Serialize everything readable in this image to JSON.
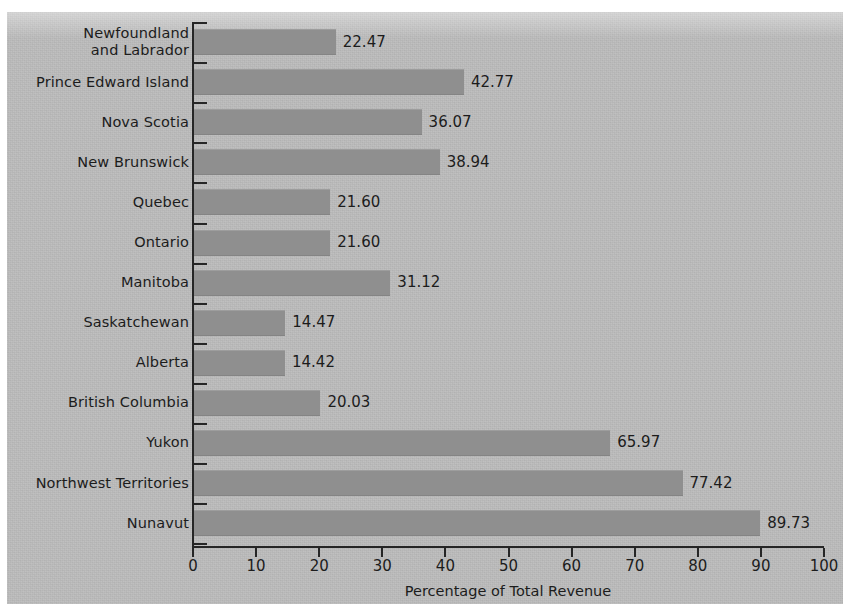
{
  "chart_data": {
    "type": "bar",
    "orientation": "horizontal",
    "title": "",
    "xlabel": "Percentage of Total Revenue",
    "ylabel": "",
    "xlim": [
      0,
      100
    ],
    "xticks": [
      "0",
      "10",
      "20",
      "30",
      "40",
      "50",
      "60",
      "70",
      "80",
      "90",
      "100"
    ],
    "grid": false,
    "legend": false,
    "categories": [
      "Newfoundland\nand Labrador",
      "Prince Edward Island",
      "Nova Scotia",
      "New Brunswick",
      "Quebec",
      "Ontario",
      "Manitoba",
      "Saskatchewan",
      "Alberta",
      "British Columbia",
      "Yukon",
      "Northwest Territories",
      "Nunavut"
    ],
    "values": [
      22.47,
      42.77,
      36.07,
      38.94,
      21.6,
      21.6,
      31.12,
      14.47,
      14.42,
      20.03,
      65.97,
      77.42,
      89.73
    ],
    "value_labels": [
      "22.47",
      "42.77",
      "36.07",
      "38.94",
      "21.60",
      "21.60",
      "31.12",
      "14.47",
      "14.42",
      "20.03",
      "65.97",
      "77.42",
      "89.73"
    ]
  },
  "rows": [
    {
      "label_line1": "Newfoundland",
      "label_line2": "and Labrador",
      "value": 22.47,
      "value_label": "22.47"
    },
    {
      "label_line1": "Prince Edward Island",
      "label_line2": "",
      "value": 42.77,
      "value_label": "42.77"
    },
    {
      "label_line1": "Nova Scotia",
      "label_line2": "",
      "value": 36.07,
      "value_label": "36.07"
    },
    {
      "label_line1": "New Brunswick",
      "label_line2": "",
      "value": 38.94,
      "value_label": "38.94"
    },
    {
      "label_line1": "Quebec",
      "label_line2": "",
      "value": 21.6,
      "value_label": "21.60"
    },
    {
      "label_line1": "Ontario",
      "label_line2": "",
      "value": 21.6,
      "value_label": "21.60"
    },
    {
      "label_line1": "Manitoba",
      "label_line2": "",
      "value": 31.12,
      "value_label": "31.12"
    },
    {
      "label_line1": "Saskatchewan",
      "label_line2": "",
      "value": 14.47,
      "value_label": "14.47"
    },
    {
      "label_line1": "Alberta",
      "label_line2": "",
      "value": 14.42,
      "value_label": "14.42"
    },
    {
      "label_line1": "British Columbia",
      "label_line2": "",
      "value": 20.03,
      "value_label": "20.03"
    },
    {
      "label_line1": "Yukon",
      "label_line2": "",
      "value": 65.97,
      "value_label": "65.97"
    },
    {
      "label_line1": "Northwest Territories",
      "label_line2": "",
      "value": 77.42,
      "value_label": "77.42"
    },
    {
      "label_line1": "Nunavut",
      "label_line2": "",
      "value": 89.73,
      "value_label": "89.73"
    }
  ],
  "axis": {
    "x_title": "Percentage of Total Revenue",
    "x_tick_labels": [
      "0",
      "10",
      "20",
      "30",
      "40",
      "50",
      "60",
      "70",
      "80",
      "90",
      "100"
    ],
    "x_min": 0,
    "x_max": 100,
    "pixels_per_unit": 6.31,
    "origin_x_px": 185
  },
  "colors": {
    "panel_background": "#bcbcbc",
    "bar_fill": "#8f8f8f",
    "axis_line": "#262626",
    "text": "#1c1c1c",
    "page_background": "#ffffff"
  }
}
